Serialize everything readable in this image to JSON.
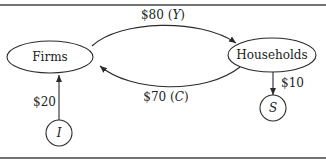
{
  "diagram": {
    "type": "circular-flow",
    "nodes": {
      "firms": {
        "label": "Firms"
      },
      "households": {
        "label": "Households"
      },
      "investment": {
        "label": "I"
      },
      "saving": {
        "label": "S"
      }
    },
    "edges": [
      {
        "from": "firms",
        "to": "households",
        "amount": "$80",
        "symbol": "Y",
        "label": "$80 (Y)"
      },
      {
        "from": "households",
        "to": "firms",
        "amount": "$70",
        "symbol": "C",
        "label": "$70 (C)"
      },
      {
        "from": "investment",
        "to": "firms",
        "amount": "$20",
        "label": "$20"
      },
      {
        "from": "households",
        "to": "saving",
        "amount": "$10",
        "label": "$10"
      }
    ],
    "colors": {
      "line": "#2a2a2a",
      "text": "#222222",
      "background": "#ffffff"
    }
  }
}
